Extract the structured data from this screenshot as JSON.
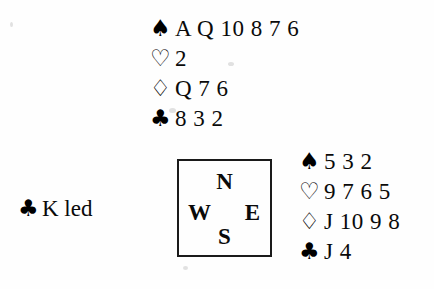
{
  "diagram": {
    "type": "bridge-hand-diagram",
    "suit_symbols": {
      "spade": "♠",
      "heart": "♡",
      "diamond": "♢",
      "club": "♣"
    },
    "hands": {
      "north": {
        "label": "North",
        "suits": [
          {
            "suit": "spade",
            "symbol": "♠",
            "style": "filled",
            "ranks": "A Q 10 8 7 6"
          },
          {
            "suit": "heart",
            "symbol": "♡",
            "style": "outline",
            "ranks": "2"
          },
          {
            "suit": "diamond",
            "symbol": "♢",
            "style": "outline",
            "ranks": "Q 7 6"
          },
          {
            "suit": "club",
            "symbol": "♣",
            "style": "filled",
            "ranks": "8 3 2"
          }
        ]
      },
      "east": {
        "label": "East",
        "suits": [
          {
            "suit": "spade",
            "symbol": "♠",
            "style": "filled",
            "ranks": "5 3 2"
          },
          {
            "suit": "heart",
            "symbol": "♡",
            "style": "outline",
            "ranks": "9 7 6 5"
          },
          {
            "suit": "diamond",
            "symbol": "♢",
            "style": "outline",
            "ranks": "J 10 9 8"
          },
          {
            "suit": "club",
            "symbol": "♣",
            "style": "filled",
            "ranks": "J 4"
          }
        ]
      }
    },
    "compass": {
      "north": "N",
      "west": "W",
      "east": "E",
      "south": "S"
    },
    "lead": {
      "suit": "club",
      "symbol": "♣",
      "text": "K led"
    },
    "colors": {
      "ink": "#0a0a0a",
      "paper": "#fefefe",
      "box_border": "#1a1a1a"
    }
  }
}
